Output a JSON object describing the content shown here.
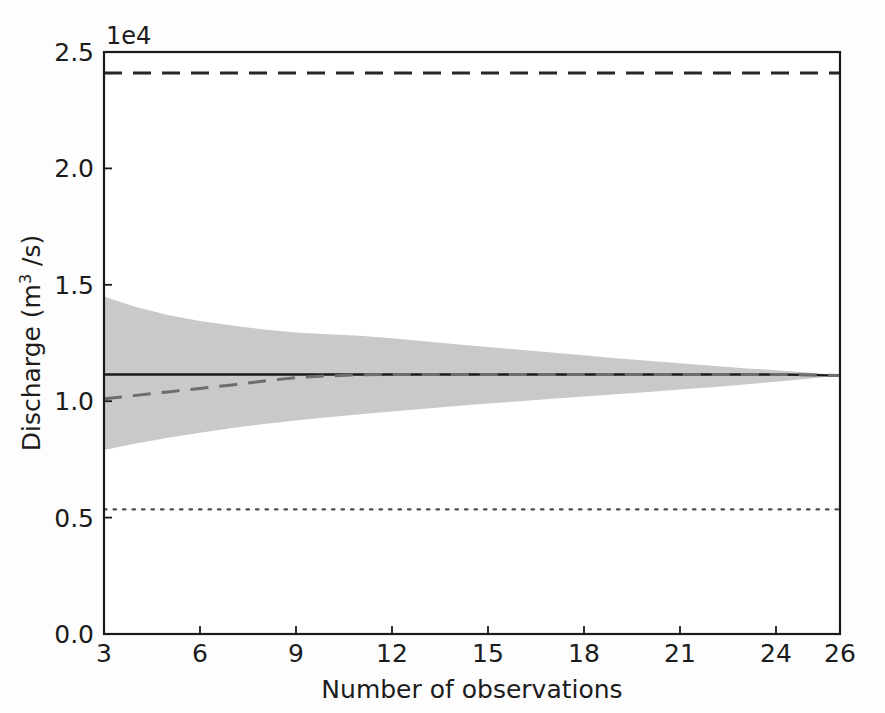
{
  "chart_data": {
    "type": "line",
    "title": "",
    "xlabel": "Number of observations",
    "ylabel": "Discharge (m³ /s)",
    "ylabel_main": "Discharge (m",
    "ylabel_sup": "3",
    "ylabel_tail": " /s)",
    "y_offset_label": "1e4",
    "xlim": [
      3,
      26
    ],
    "ylim": [
      0.0,
      25000
    ],
    "xticks": [
      3,
      6,
      9,
      12,
      15,
      18,
      21,
      24,
      26
    ],
    "xticklabels": [
      "3",
      "6",
      "9",
      "12",
      "15",
      "18",
      "21",
      "24",
      "26"
    ],
    "yticks": [
      0,
      5000,
      10000,
      15000,
      20000,
      25000
    ],
    "yticklabels": [
      "0.0",
      "0.5",
      "1.0",
      "1.5",
      "2.0",
      "2.5"
    ],
    "grid": false,
    "legend": "none",
    "x": [
      3,
      4,
      5,
      6,
      7,
      8,
      9,
      10,
      11,
      12,
      13,
      14,
      15,
      16,
      17,
      18,
      19,
      20,
      21,
      22,
      23,
      24,
      25,
      26
    ],
    "series": [
      {
        "name": "Upper reference (dashed black)",
        "style": "dashed",
        "color": "#262626",
        "values": [
          24100,
          24100,
          24100,
          24100,
          24100,
          24100,
          24100,
          24100,
          24100,
          24100,
          24100,
          24100,
          24100,
          24100,
          24100,
          24100,
          24100,
          24100,
          24100,
          24100,
          24100,
          24100,
          24100,
          24100
        ]
      },
      {
        "name": "Mean estimate (solid black)",
        "style": "solid",
        "color": "#1a1a1a",
        "values": [
          11150,
          11150,
          11150,
          11150,
          11150,
          11150,
          11150,
          11150,
          11150,
          11150,
          11150,
          11150,
          11150,
          11150,
          11150,
          11150,
          11150,
          11150,
          11150,
          11150,
          11150,
          11150,
          11130,
          11100
        ]
      },
      {
        "name": "Sample mean (dashed gray)",
        "style": "dashed",
        "color": "#6d6d6d",
        "values": [
          10100,
          10250,
          10400,
          10550,
          10700,
          10870,
          11010,
          11090,
          11130,
          11150,
          11150,
          11150,
          11150,
          11150,
          11150,
          11150,
          11150,
          11150,
          11150,
          11150,
          11150,
          11150,
          11130,
          11100
        ]
      },
      {
        "name": "Lower reference (dotted)",
        "style": "dotted",
        "color": "#4d4d4d",
        "values": [
          5350,
          5350,
          5350,
          5350,
          5350,
          5350,
          5350,
          5350,
          5350,
          5350,
          5350,
          5350,
          5350,
          5350,
          5350,
          5350,
          5350,
          5350,
          5350,
          5350,
          5350,
          5350,
          5350,
          5350
        ]
      }
    ],
    "band": {
      "name": "Confidence interval",
      "color": "#c9c9c9",
      "upper": [
        14500,
        14050,
        13700,
        13450,
        13250,
        13080,
        12950,
        12880,
        12810,
        12700,
        12580,
        12450,
        12330,
        12210,
        12090,
        11970,
        11850,
        11740,
        11630,
        11520,
        11420,
        11330,
        11230,
        11100
      ],
      "lower": [
        7900,
        8180,
        8430,
        8650,
        8850,
        9020,
        9170,
        9310,
        9440,
        9560,
        9680,
        9790,
        9900,
        10000,
        10100,
        10200,
        10300,
        10400,
        10500,
        10600,
        10720,
        10840,
        10960,
        11100
      ]
    }
  },
  "axes": {
    "x_axis_name": "x-axis",
    "y_axis_name": "y-axis"
  }
}
